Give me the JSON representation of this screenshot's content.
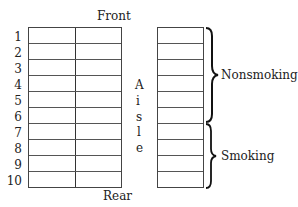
{
  "labels": {
    "front": "Front",
    "rear": "Rear",
    "aisle_letters": [
      "A",
      "i",
      "s",
      "l",
      "e"
    ],
    "nonsmoking": "Nonsmoking",
    "smoking": "Smoking"
  },
  "rows": [
    "1",
    "2",
    "3",
    "4",
    "5",
    "6",
    "7",
    "8",
    "9",
    "10"
  ],
  "sections": [
    {
      "name": "Nonsmoking",
      "rows": [
        1,
        6
      ]
    },
    {
      "name": "Smoking",
      "rows": [
        7,
        10
      ]
    }
  ]
}
